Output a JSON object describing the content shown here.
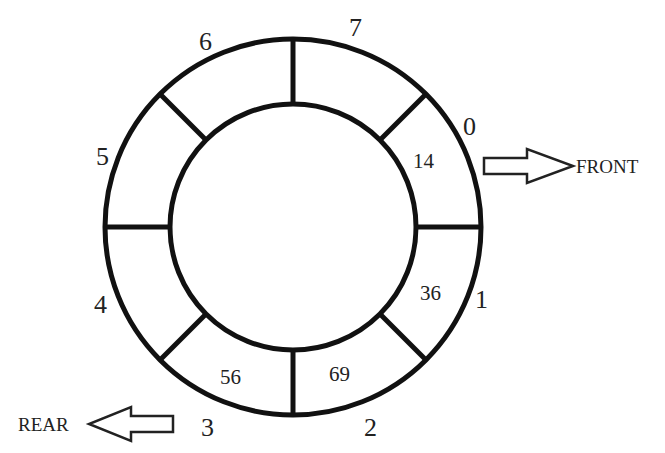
{
  "diagram": {
    "capacity": 8,
    "slots": [
      {
        "index": "0",
        "value": "14"
      },
      {
        "index": "1",
        "value": "36"
      },
      {
        "index": "2",
        "value": "69"
      },
      {
        "index": "3",
        "value": "56"
      },
      {
        "index": "4",
        "value": ""
      },
      {
        "index": "5",
        "value": ""
      },
      {
        "index": "6",
        "value": ""
      },
      {
        "index": "7",
        "value": ""
      }
    ],
    "pointers": {
      "front": {
        "label": "FRONT",
        "points_to_index": "0"
      },
      "rear": {
        "label": "REAR",
        "points_to_index": "3"
      }
    }
  }
}
